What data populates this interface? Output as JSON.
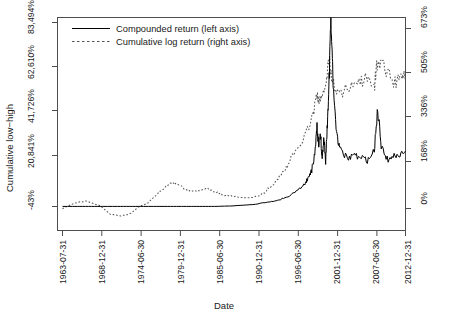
{
  "chart_data": {
    "type": "line",
    "title": "",
    "xlabel": "Date",
    "ylabel": "Cumulative low-high",
    "y_left_axis_label": "Cumulative low−high",
    "x_tick_labels": [
      "1963-07-31",
      "1968-12-31",
      "1974-06-30",
      "1979-12-31",
      "1985-06-30",
      "1990-12-31",
      "1996-06-30",
      "2001-12-31",
      "2007-06-30",
      "2012-12-31"
    ],
    "y_left_tick_labels": [
      "-43%",
      "20,841%",
      "41,726%",
      "62,610%",
      "83,494%"
    ],
    "y_right_tick_labels": [
      "0%",
      "168%",
      "336%",
      "505%",
      "673%"
    ],
    "y_left_tick_values": [
      -43,
      20841,
      41726,
      62610,
      83494
    ],
    "y_right_tick_values": [
      0,
      168,
      336,
      505,
      673
    ],
    "ylim_left": [
      -43,
      83494
    ],
    "ylim_right": [
      0,
      673
    ],
    "grid": false,
    "legend_position": "top-left",
    "legend": [
      {
        "label": "Compounded return (left axis)",
        "style": "solid",
        "axis": "left"
      },
      {
        "label": "Cumulative log return (right axis)",
        "style": "dotted",
        "axis": "right"
      }
    ],
    "series": [
      {
        "name": "Compounded return (left axis)",
        "style": "solid",
        "axis": "left",
        "color": "#000000",
        "x": [
          "1963-07-31",
          "1966-01-31",
          "1968-12-31",
          "1971-06-30",
          "1974-06-30",
          "1977-01-31",
          "1979-12-31",
          "1982-06-30",
          "1985-06-30",
          "1987-12-31",
          "1990-12-31",
          "1993-06-30",
          "1994-12-31",
          "1996-06-30",
          "1997-06-30",
          "1998-06-30",
          "1998-12-31",
          "1999-06-30",
          "1999-12-31",
          "2000-03-31",
          "2000-06-30",
          "2000-09-30",
          "2000-12-31",
          "2001-03-31",
          "2001-06-30",
          "2001-09-30",
          "2001-12-31",
          "2002-03-31",
          "2002-06-30",
          "2002-12-31",
          "2003-06-30",
          "2004-06-30",
          "2005-06-30",
          "2006-06-30",
          "2007-06-30",
          "2008-06-30",
          "2008-12-31",
          "2009-06-30",
          "2010-06-30",
          "2011-06-30",
          "2012-06-30",
          "2012-12-31"
        ],
        "values": [
          0,
          0,
          0,
          0,
          0,
          0,
          0,
          0,
          0,
          210,
          840,
          2090,
          3130,
          5010,
          7510,
          10430,
          12940,
          16280,
          25000,
          36000,
          27000,
          33000,
          22000,
          31000,
          20000,
          38000,
          56000,
          83000,
          62000,
          33000,
          26000,
          22000,
          23000,
          22000,
          21000,
          25000,
          44000,
          27000,
          21000,
          23000,
          24000,
          25000
        ]
      },
      {
        "name": "Cumulative log return (right axis)",
        "style": "dotted",
        "axis": "right",
        "color": "#555555",
        "x": [
          "1963-07-31",
          "1965-06-30",
          "1966-12-31",
          "1968-12-31",
          "1970-06-30",
          "1971-12-31",
          "1973-06-30",
          "1974-06-30",
          "1975-12-31",
          "1977-06-30",
          "1978-12-31",
          "1979-12-31",
          "1981-06-30",
          "1982-12-31",
          "1984-06-30",
          "1985-06-30",
          "1986-12-31",
          "1988-06-30",
          "1990-12-31",
          "1992-06-30",
          "1993-12-31",
          "1995-06-30",
          "1996-06-30",
          "1997-12-31",
          "1999-06-30",
          "2000-03-31",
          "2000-09-30",
          "2001-06-30",
          "2001-12-31",
          "2002-06-30",
          "2003-06-30",
          "2004-12-31",
          "2006-06-30",
          "2007-06-30",
          "2008-06-30",
          "2008-12-31",
          "2009-12-31",
          "2011-06-30",
          "2012-06-30",
          "2012-12-31"
        ],
        "values": [
          0,
          22,
          28,
          10,
          -22,
          -28,
          -18,
          5,
          22,
          60,
          95,
          92,
          70,
          62,
          78,
          62,
          50,
          44,
          40,
          55,
          95,
          140,
          185,
          250,
          330,
          420,
          400,
          460,
          560,
          470,
          430,
          450,
          470,
          490,
          455,
          560,
          520,
          470,
          505,
          510
        ]
      }
    ]
  },
  "axis_ticks": {
    "left_count": 5,
    "right_count": 5,
    "bottom_count": 10
  }
}
